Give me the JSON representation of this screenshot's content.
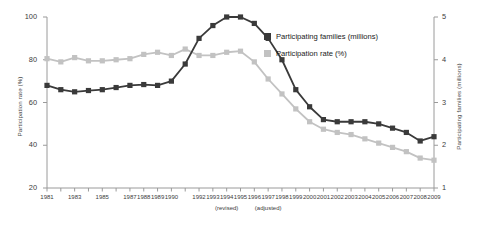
{
  "chart_data": {
    "type": "line",
    "title": "",
    "xlabel": "",
    "x": [
      "1981",
      "1982",
      "1983",
      "1984",
      "1985",
      "1986",
      "1987",
      "1988",
      "1989",
      "1990",
      "1991",
      "1992",
      "1993",
      "1994",
      "1995",
      "1996",
      "1997",
      "1998",
      "1999",
      "2000",
      "2001",
      "2002",
      "2003",
      "2004",
      "2005",
      "2006",
      "2007",
      "2008",
      "2009"
    ],
    "x_tick_labels": [
      "1981",
      "1983",
      "1985",
      "1987",
      "1988",
      "1989",
      "1990",
      "1992",
      "1993",
      "1994",
      "1995",
      "1996",
      "1997",
      "1998",
      "1999",
      "2000",
      "2001",
      "2002",
      "2003",
      "2004",
      "2005",
      "2006",
      "2007",
      "2008",
      "2009"
    ],
    "x_annotations": [
      {
        "label": "(revised)",
        "under": "1994"
      },
      {
        "label": "(adjusted)",
        "under": "1997"
      }
    ],
    "grid": false,
    "legend_position": "upper-right",
    "series": [
      {
        "name": "Participating families (millions)",
        "axis": "right",
        "color": "#3a3a3a",
        "marker": "square",
        "values": [
          3.4,
          3.3,
          3.25,
          3.28,
          3.3,
          3.35,
          3.4,
          3.42,
          3.4,
          3.5,
          3.9,
          4.5,
          4.8,
          5.0,
          5.0,
          4.85,
          4.5,
          4.0,
          3.3,
          2.9,
          2.6,
          2.55,
          2.55,
          2.55,
          2.5,
          2.4,
          2.3,
          2.1,
          2.2
        ]
      },
      {
        "name": "Participation rate (%)",
        "axis": "left",
        "color": "#c2c2c2",
        "marker": "square",
        "values": [
          80.5,
          79.0,
          81.0,
          79.5,
          79.5,
          80.0,
          80.5,
          82.5,
          83.5,
          82.0,
          85.0,
          82.0,
          82.0,
          83.5,
          84.0,
          79.0,
          71.0,
          64.0,
          57.0,
          51.0,
          47.5,
          46.0,
          45.0,
          43.0,
          41.0,
          39.0,
          37.0,
          34.0,
          33.0
        ]
      }
    ],
    "left_axis": {
      "label": "Participation rate (%)",
      "ticks": [
        20,
        40,
        60,
        80,
        100
      ],
      "min": 20,
      "max": 100
    },
    "right_axis": {
      "label": "Participating families (millions)",
      "ticks": [
        1,
        2,
        3,
        4,
        5
      ],
      "min": 1,
      "max": 5
    }
  },
  "legend": {
    "items": [
      {
        "label": "Participating families (millions)",
        "color": "#3a3a3a"
      },
      {
        "label": "Participation rate (%)",
        "color": "#c2c2c2"
      }
    ]
  }
}
